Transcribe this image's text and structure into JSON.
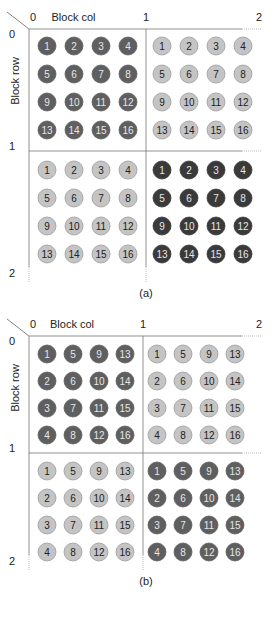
{
  "figure": {
    "axis": {
      "col_label": "Block col",
      "row_label": "Block row"
    },
    "colors": {
      "dark": "#5f5f5f",
      "darkest": "#3a3a3a",
      "light": "#c4c4c4",
      "light_stroke": "#9a9a9a"
    },
    "panels": [
      {
        "id": "a",
        "caption": "(a)",
        "col_ticks": [
          "0",
          "1",
          "2"
        ],
        "row_ticks": [
          "0",
          "1",
          "2"
        ],
        "blocks": [
          {
            "row": 0,
            "col": 0,
            "shade": "dark",
            "grid": [
              [
                "1",
                "2",
                "3",
                "4"
              ],
              [
                "5",
                "6",
                "7",
                "8"
              ],
              [
                "9",
                "10",
                "11",
                "12"
              ],
              [
                "13",
                "14",
                "15",
                "16"
              ]
            ]
          },
          {
            "row": 0,
            "col": 1,
            "shade": "light",
            "grid": [
              [
                "1",
                "2",
                "3",
                "4"
              ],
              [
                "5",
                "6",
                "7",
                "8"
              ],
              [
                "9",
                "10",
                "11",
                "12"
              ],
              [
                "13",
                "14",
                "15",
                "16"
              ]
            ]
          },
          {
            "row": 1,
            "col": 0,
            "shade": "light",
            "grid": [
              [
                "1",
                "2",
                "3",
                "4"
              ],
              [
                "5",
                "6",
                "7",
                "8"
              ],
              [
                "9",
                "10",
                "11",
                "12"
              ],
              [
                "13",
                "14",
                "15",
                "16"
              ]
            ]
          },
          {
            "row": 1,
            "col": 1,
            "shade": "darkest",
            "grid": [
              [
                "1",
                "2",
                "3",
                "4"
              ],
              [
                "5",
                "6",
                "7",
                "8"
              ],
              [
                "9",
                "10",
                "11",
                "12"
              ],
              [
                "13",
                "14",
                "15",
                "16"
              ]
            ]
          }
        ]
      },
      {
        "id": "b",
        "caption": "(b)",
        "col_ticks": [
          "0",
          "1",
          "2"
        ],
        "row_ticks": [
          "0",
          "1",
          "2"
        ],
        "blocks": [
          {
            "row": 0,
            "col": 0,
            "shade": "dark",
            "grid": [
              [
                "1",
                "5",
                "9",
                "13"
              ],
              [
                "2",
                "6",
                "10",
                "14"
              ],
              [
                "3",
                "7",
                "11",
                "15"
              ],
              [
                "4",
                "8",
                "12",
                "16"
              ]
            ]
          },
          {
            "row": 0,
            "col": 1,
            "shade": "light",
            "grid": [
              [
                "1",
                "5",
                "9",
                "13"
              ],
              [
                "2",
                "6",
                "10",
                "14"
              ],
              [
                "3",
                "7",
                "11",
                "15"
              ],
              [
                "4",
                "8",
                "12",
                "16"
              ]
            ]
          },
          {
            "row": 1,
            "col": 0,
            "shade": "light",
            "grid": [
              [
                "1",
                "5",
                "9",
                "13"
              ],
              [
                "2",
                "6",
                "10",
                "14"
              ],
              [
                "3",
                "7",
                "11",
                "15"
              ],
              [
                "4",
                "8",
                "12",
                "16"
              ]
            ]
          },
          {
            "row": 1,
            "col": 1,
            "shade": "dark",
            "grid": [
              [
                "1",
                "5",
                "9",
                "13"
              ],
              [
                "2",
                "6",
                "10",
                "14"
              ],
              [
                "3",
                "7",
                "11",
                "15"
              ],
              [
                "4",
                "8",
                "12",
                "16"
              ]
            ]
          }
        ]
      }
    ]
  }
}
